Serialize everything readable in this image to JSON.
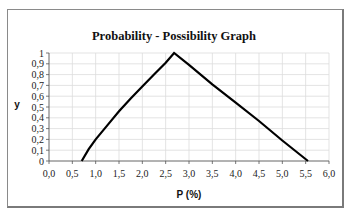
{
  "chart_data": {
    "type": "line",
    "title": "Probability - Possibility Graph",
    "xlabel": "P (%)",
    "ylabel": "y",
    "xlim": [
      0,
      6
    ],
    "ylim": [
      0,
      1
    ],
    "x_ticks": [
      "0,0",
      "0,5",
      "1,0",
      "1,5",
      "2,0",
      "2,5",
      "3,0",
      "3,5",
      "4,0",
      "4,5",
      "5,0",
      "5,5",
      "6,0"
    ],
    "y_ticks": [
      "0",
      "0,1",
      "0,2",
      "0,3",
      "0,4",
      "0,5",
      "0,6",
      "0,7",
      "0,8",
      "0,9",
      "1"
    ],
    "grid": true,
    "legend": "none",
    "series": [
      {
        "name": "possibility",
        "color": "#000000",
        "x": [
          0.7,
          0.85,
          1.0,
          1.25,
          1.5,
          1.75,
          2.0,
          2.25,
          2.5,
          2.68,
          3.0,
          3.5,
          4.0,
          4.5,
          5.0,
          5.55
        ],
        "y": [
          0.0,
          0.11,
          0.2,
          0.33,
          0.46,
          0.58,
          0.69,
          0.8,
          0.91,
          1.0,
          0.89,
          0.71,
          0.54,
          0.37,
          0.19,
          0.0
        ]
      }
    ]
  }
}
